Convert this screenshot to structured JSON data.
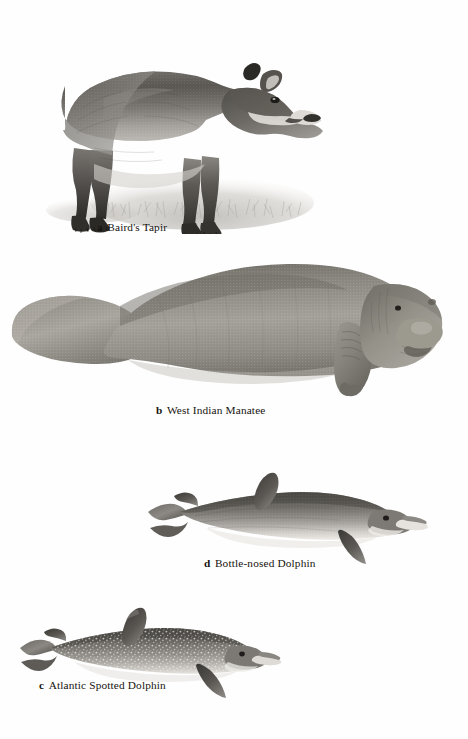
{
  "page": {
    "background_color": "#fefefe",
    "text_color": "#17140f",
    "width": 468,
    "height": 739,
    "type": "illustration-plate"
  },
  "figures": [
    {
      "id": "a",
      "label": "a",
      "name": "Baird's Tapir",
      "caption_full": "a  Baird's Tapir",
      "art_name": "tapir-illustration",
      "description": "grayscale stipple engraving of a tapir standing in profile facing right with low brush at its feet",
      "tone_dark": "#4a4742",
      "tone_mid": "#8d8a85",
      "tone_light": "#c9c6c1"
    },
    {
      "id": "b",
      "label": "b",
      "name": "West Indian Manatee",
      "caption_full": "b  West Indian Manatee",
      "art_name": "manatee-illustration",
      "description": "grayscale stipple engraving of a manatee in profile facing right with paddle tail at left",
      "tone_dark": "#6e6b66",
      "tone_mid": "#97948f",
      "tone_light": "#bdbab5"
    },
    {
      "id": "d",
      "label": "d",
      "name": "Bottle-nosed Dolphin",
      "caption_full": "d  Bottle-nosed Dolphin",
      "art_name": "bottlenose-dolphin-illustration",
      "description": "grayscale stipple engraving of a bottlenose dolphin in profile facing right",
      "tone_dark": "#56534e",
      "tone_mid": "#8b8883",
      "tone_light": "#d2cfca"
    },
    {
      "id": "c",
      "label": "c",
      "name": "Atlantic Spotted Dolphin",
      "caption_full": "c  Atlantic Spotted Dolphin",
      "art_name": "spotted-dolphin-illustration",
      "description": "grayscale stipple engraving of an Atlantic spotted dolphin in profile facing right, body covered in pale speckles",
      "tone_dark": "#55524d",
      "tone_mid": "#8a8782",
      "tone_light": "#cfccc7"
    }
  ]
}
